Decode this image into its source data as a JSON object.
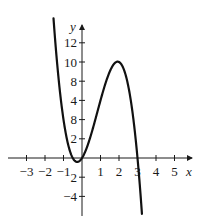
{
  "chart_data": {
    "type": "line",
    "title": "",
    "xlabel": "x",
    "ylabel": "y",
    "xlim": [
      -3.8,
      5.8
    ],
    "ylim": [
      -5.5,
      14
    ],
    "grid": false,
    "legend": null,
    "x_ticks": [
      -3,
      -2,
      -1,
      1,
      2,
      3,
      4,
      5
    ],
    "x_tick_labels": [
      "−3",
      "−2",
      "−1",
      "1",
      "2",
      "3",
      "4",
      "5"
    ],
    "y_ticks": [
      12,
      10,
      8,
      6,
      4,
      2,
      -2,
      -4
    ],
    "y_tick_labels": [
      "12",
      "10",
      "8",
      "4",
      "8",
      "2",
      "2",
      "−4"
    ],
    "series": [
      {
        "name": "f(x)",
        "description": "cubic curve, local min near (-0.3, -0.5), local max at (2, 10), crosses x-axis at 0 and 3",
        "x": [
          -1.55,
          -1.5,
          -1.25,
          -1.0,
          -0.75,
          -0.5,
          -0.25,
          0,
          0.25,
          0.5,
          0.75,
          1.0,
          1.25,
          1.5,
          1.75,
          2.0,
          2.25,
          2.5,
          2.75,
          3.0,
          3.25,
          3.4
        ],
        "y": [
          14.6,
          13.5,
          9.1,
          5.0,
          2.3,
          0.0,
          -0.4,
          0.0,
          1.1,
          2.5,
          4.1,
          6.0,
          7.5,
          9.0,
          9.7,
          10.0,
          9.5,
          8.0,
          5.5,
          0.0,
          -5.5,
          -8.3
        ]
      }
    ]
  },
  "axes": {
    "x_label": "x",
    "y_label": "y"
  }
}
